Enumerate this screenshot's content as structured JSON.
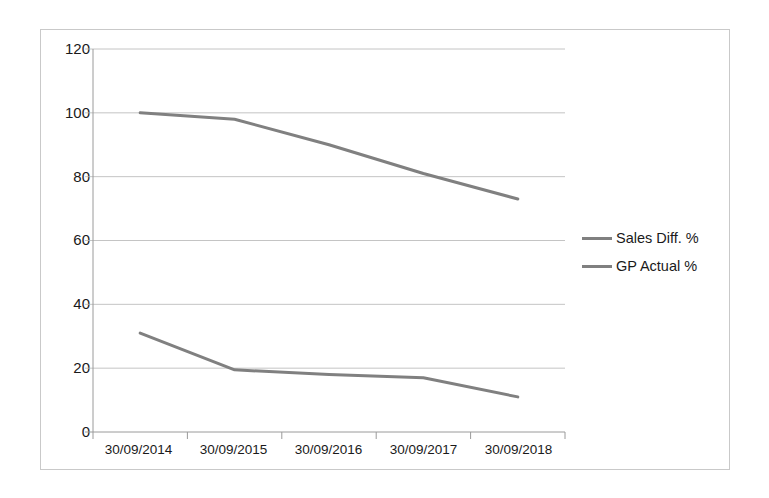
{
  "chart_data": {
    "type": "line",
    "title": "",
    "xlabel": "",
    "ylabel": "",
    "categories": [
      "30/09/2014",
      "30/09/2015",
      "30/09/2016",
      "30/09/2017",
      "30/09/2018"
    ],
    "series": [
      {
        "name": "Sales Diff. %",
        "color": "#808080",
        "values": [
          100,
          98,
          90,
          81,
          73
        ]
      },
      {
        "name": "GP Actual %",
        "color": "#808080",
        "values": [
          31,
          19.5,
          18,
          17,
          11
        ]
      }
    ],
    "ylim": [
      0,
      120
    ],
    "yticks": [
      0,
      20,
      40,
      60,
      80,
      100,
      120
    ],
    "ytick_labels": [
      "0",
      "20",
      "40",
      "60",
      "80",
      "100",
      "120"
    ],
    "grid": true,
    "grid_axis": "y",
    "legend_position": "right",
    "plot_border": false,
    "axis_color": "#9a9a9a",
    "grid_color": "#b5b5b5",
    "frame_color": "#c9c9c9"
  },
  "legend": {
    "entries": [
      {
        "label": "Sales Diff. %"
      },
      {
        "label": "GP Actual %"
      }
    ]
  },
  "axes": {
    "y_labels": [
      "120",
      "100",
      "80",
      "60",
      "40",
      "20",
      "0"
    ],
    "x_labels": [
      "30/09/2014",
      "30/09/2015",
      "30/09/2016",
      "30/09/2017",
      "30/09/2018"
    ]
  }
}
